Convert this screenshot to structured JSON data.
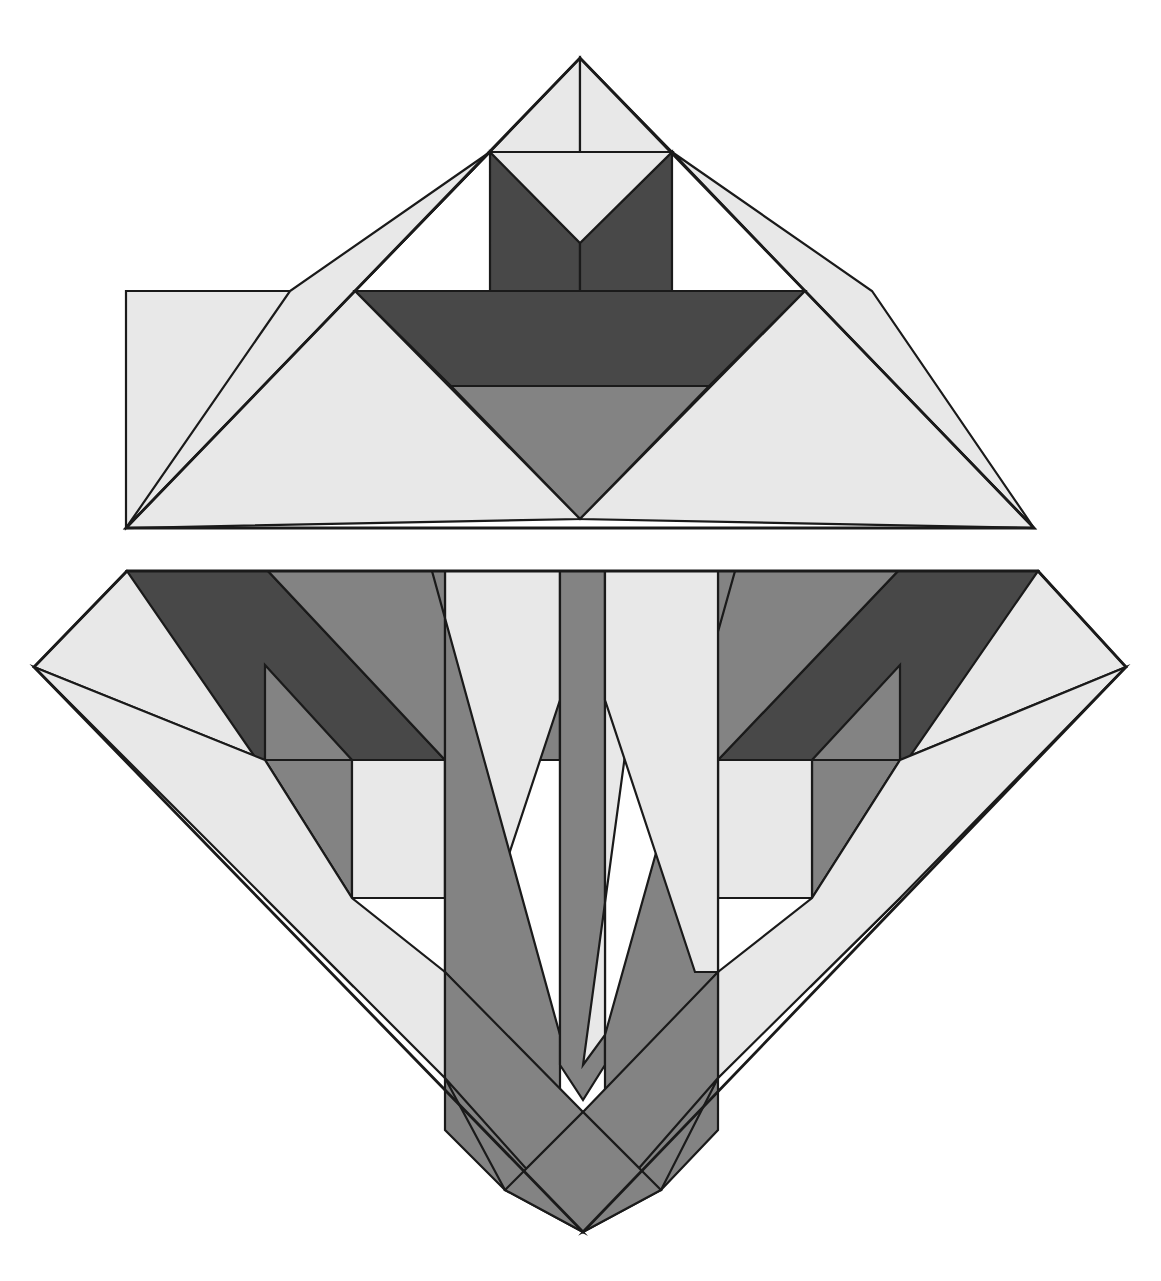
{
  "artwork": {
    "title": "Geometric Quilt Block — Tulip in Vase",
    "width": 1161,
    "height": 1281,
    "background_color": "#ffffff",
    "outline_color": "#1a1a1a",
    "outline_width": 2.2
  },
  "palette": {
    "light": "#e8e8e8",
    "medium": "#838383",
    "dark": "#484848",
    "background": "#ffffff",
    "outline": "#1a1a1a"
  },
  "blocks": [
    {
      "name": "upper-triangle-block",
      "label": "Upper Triangle Block",
      "shape": "triangle",
      "apex": [
        580,
        58
      ],
      "base_left": [
        126,
        528
      ],
      "base_right": [
        1034,
        528
      ]
    },
    {
      "name": "lower-diamond-block",
      "label": "Lower Diamond Block",
      "shape": "diamond-truncated-top",
      "top_left": [
        127,
        571
      ],
      "top_right": [
        1038,
        571
      ],
      "left": [
        34,
        667
      ],
      "right": [
        1126,
        667
      ],
      "bottom": [
        583,
        1232
      ]
    }
  ],
  "upper_pieces": [
    {
      "name": "upper-apex-light-left",
      "fill": "light",
      "points": "580,58 490,152 580,152"
    },
    {
      "name": "upper-apex-light-right",
      "fill": "light",
      "points": "580,58 672,152 580,152"
    },
    {
      "name": "upper-left-light-wing",
      "fill": "light",
      "points": "490,152 355,291 126,528 126,291 355,291"
    },
    {
      "name": "upper-left-light-outer",
      "fill": "light",
      "points": "490,152 355,291 126,528 290,291"
    },
    {
      "name": "upper-petal-dark-left",
      "fill": "dark",
      "points": "490,152 490,291 580,291 580,243"
    },
    {
      "name": "upper-petal-dark-center",
      "fill": "dark",
      "points": "580,243 580,291 672,291 672,152"
    },
    {
      "name": "upper-petal-light-notch",
      "fill": "light",
      "points": "490,152 580,243 672,152"
    },
    {
      "name": "upper-right-light-wing",
      "fill": "light",
      "points": "672,152 805,291 1034,528 872,291"
    },
    {
      "name": "upper-vase-dark-body",
      "fill": "dark",
      "points": "355,291 805,291 709,386 451,386"
    },
    {
      "name": "upper-vase-medium-foot",
      "fill": "medium",
      "points": "451,386 709,386 580,519"
    },
    {
      "name": "upper-base-light-left",
      "fill": "light",
      "points": "126,528 355,291 580,519"
    },
    {
      "name": "upper-base-light-right",
      "fill": "light",
      "points": "1034,528 805,291 580,519"
    }
  ],
  "lower_pieces": [
    {
      "name": "lower-left-corner-light",
      "fill": "light",
      "points": "127,571 34,667 265,760 265,665"
    },
    {
      "name": "lower-left-band-dark",
      "fill": "dark",
      "points": "127,571 268,571 445,760 445,898 352,898"
    },
    {
      "name": "lower-left-band-medium",
      "fill": "medium",
      "points": "268,571 432,571 560,700 560,760 445,760"
    },
    {
      "name": "lower-left-inner-medium-tri",
      "fill": "medium",
      "points": "265,665 352,760 265,760"
    },
    {
      "name": "lower-left-inner-medium-wedge",
      "fill": "medium",
      "points": "265,760 352,760 352,898 265,898"
    },
    {
      "name": "lower-left-inner-light",
      "fill": "light",
      "points": "352,760 445,760 445,898 352,898"
    },
    {
      "name": "lower-left-lower-light",
      "fill": "light",
      "points": "265,760 265,898 352,985 352,898"
    },
    {
      "name": "lower-left-outer-light",
      "fill": "light",
      "points": "34,667 265,898 445,1078 445,972 352,898 265,760"
    },
    {
      "name": "lower-right-corner-light",
      "fill": "light",
      "points": "1038,571 1126,667 900,760 900,665"
    },
    {
      "name": "lower-right-band-dark",
      "fill": "dark",
      "points": "1038,571 898,571 718,760 718,898 812,898"
    },
    {
      "name": "lower-right-band-medium",
      "fill": "medium",
      "points": "898,571 735,571 605,700 605,760 718,760"
    },
    {
      "name": "lower-right-inner-medium-tri",
      "fill": "medium",
      "points": "900,665 812,760 900,760"
    },
    {
      "name": "lower-right-inner-medium-wedge",
      "fill": "medium",
      "points": "900,760 812,760 812,898 900,898"
    },
    {
      "name": "lower-right-inner-light",
      "fill": "light",
      "points": "812,760 718,760 718,898 812,898"
    },
    {
      "name": "lower-right-lower-light",
      "fill": "light",
      "points": "900,760 900,898 812,985 812,898"
    },
    {
      "name": "lower-right-outer-light",
      "fill": "light",
      "points": "1126,667 900,898 718,1078 718,972 812,898 900,760"
    },
    {
      "name": "leaf-outer-left-light",
      "fill": "light",
      "points": "445,571 560,571 560,700 470,972 445,972"
    },
    {
      "name": "leaf-blade-left-medium",
      "fill": "medium",
      "points": "432,571 445,571 445,972 560,1100 560,1035"
    },
    {
      "name": "leaf-stem-left-light",
      "fill": "light",
      "points": "560,571 605,571 583,1065 560,1035"
    },
    {
      "name": "leaf-stem-center-medium",
      "fill": "medium",
      "points": "560,571 605,571 605,1065 583,1100 560,1065"
    },
    {
      "name": "leaf-stem-right-light",
      "fill": "light",
      "points": "605,571 650,571 583,1065 605,1035"
    },
    {
      "name": "leaf-blade-right-medium",
      "fill": "medium",
      "points": "735,571 718,571 718,972 605,1100 605,1035"
    },
    {
      "name": "leaf-outer-right-light",
      "fill": "light",
      "points": "718,571 605,571 605,700 695,972 718,972"
    },
    {
      "name": "base-v-left-medium",
      "fill": "medium",
      "points": "445,972 583,1112 505,1190 445,1130"
    },
    {
      "name": "base-v-left-lower-medium",
      "fill": "medium",
      "points": "445,1078 583,1232 505,1190"
    },
    {
      "name": "base-v-right-medium",
      "fill": "medium",
      "points": "718,972 583,1112 661,1190 718,1130"
    },
    {
      "name": "base-v-right-lower-medium",
      "fill": "medium",
      "points": "718,1078 583,1232 661,1190"
    },
    {
      "name": "base-v-center-medium",
      "fill": "medium",
      "points": "505,1190 583,1112 661,1190 583,1232"
    }
  ],
  "outline_paths": [
    {
      "name": "upper-triangle-outline",
      "points": "580,58 1034,528 126,528"
    },
    {
      "name": "lower-diamond-outline",
      "points": "127,571 1038,571 1126,667 583,1232 34,667"
    }
  ]
}
